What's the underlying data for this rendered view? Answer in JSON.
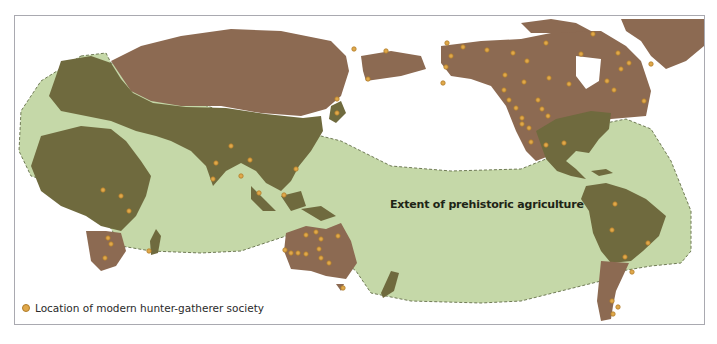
{
  "map": {
    "title_label": "Extent of prehistoric agriculture",
    "legend": {
      "items": [
        {
          "symbol": "orange-dot",
          "label": "Location of modern hunter-gatherer society",
          "color": "#e0a84a"
        }
      ]
    },
    "colors": {
      "ocean": "#ffffff",
      "agriculture_extent": "#c5d8a8",
      "agriculture_land": "#6f6a3e",
      "non_agriculture_land": "#8c6a52",
      "site_dot": "#e0a84a",
      "frame_border": "#a9a9b0"
    },
    "regions": [
      {
        "name": "Eurasia-north",
        "type": "non-agricultural land"
      },
      {
        "name": "Europe-South-Asia",
        "type": "agricultural land"
      },
      {
        "name": "Africa-north-central",
        "type": "agricultural land"
      },
      {
        "name": "Southern Africa",
        "type": "non-agricultural land"
      },
      {
        "name": "Australia",
        "type": "non-agricultural land"
      },
      {
        "name": "North America north",
        "type": "non-agricultural land"
      },
      {
        "name": "Eastern North America & Mesoamerica",
        "type": "agricultural land"
      },
      {
        "name": "South America north",
        "type": "agricultural land"
      },
      {
        "name": "Southern South America",
        "type": "non-agricultural land"
      },
      {
        "name": "Greenland",
        "type": "non-agricultural land"
      }
    ]
  }
}
